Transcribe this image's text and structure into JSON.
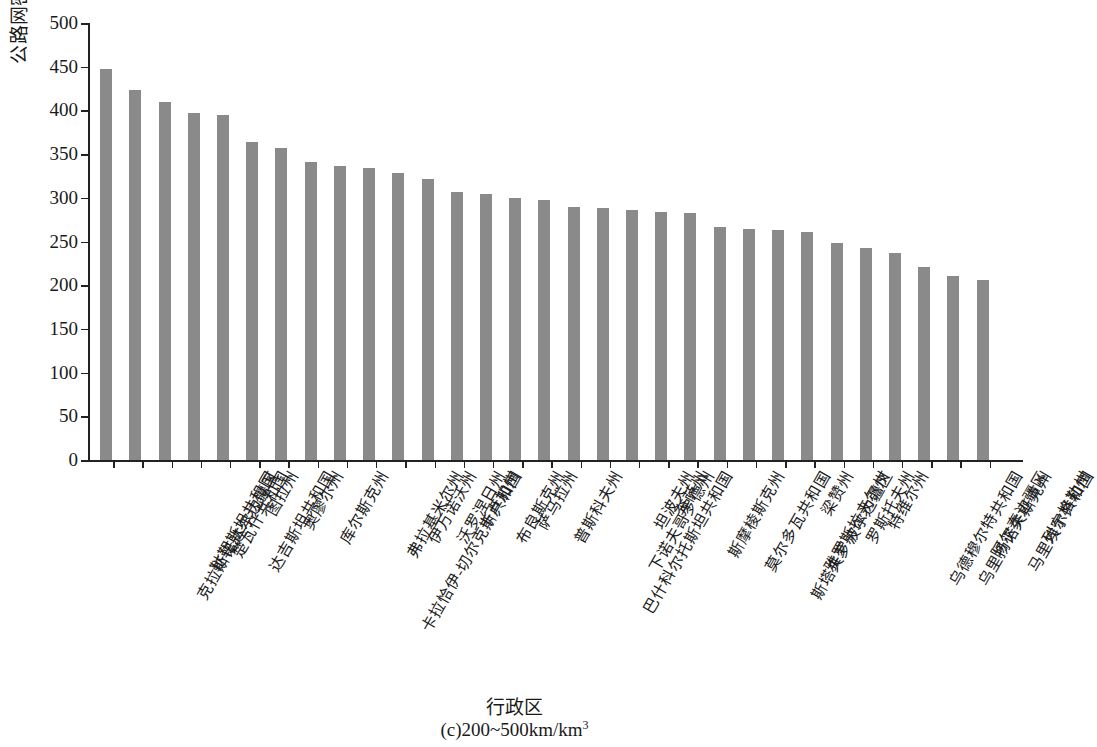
{
  "chart_data": {
    "type": "bar",
    "title": "",
    "caption": "(c)200~500km/km³",
    "caption_main": "(c)200~500km/km",
    "caption_sup": "3",
    "xlabel": "行政区",
    "ylabel": "公路网密度/(km/km³)",
    "ylabel_main": "公路网密度/(km/km",
    "ylabel_sup": "3",
    "ylabel_tail": ")",
    "ylim": [
      0,
      500
    ],
    "ytick_step": 50,
    "yticks": [
      0,
      50,
      100,
      150,
      200,
      250,
      300,
      350,
      400,
      450,
      500
    ],
    "grid": false,
    "legend": null,
    "bar_color": "#8a8a8a",
    "axis_color": "#222222",
    "categories": [
      "克拉斯诺达尔边疆区",
      "鞑靼斯坦共和国",
      "楚瓦什共和国",
      "达吉斯坦共和国",
      "图拉州",
      "奥廖尔州",
      "库尔斯克州",
      "卡拉恰伊-切尔克斯共和国",
      "弗拉基米尔州",
      "伊万诺沃州",
      "沃罗涅日州",
      "卡卢加州",
      "布良斯克州",
      "萨马拉州",
      "普斯科夫州",
      "巴什科尔托斯坦共和国",
      "下诺夫哥罗德州",
      "坦波夫州",
      "奔萨州",
      "斯摩棱斯克州",
      "莫尔多瓦共和国",
      "斯塔夫罗波尔边疆区",
      "雅罗斯拉夫尔州",
      "梁赞州",
      "罗斯托夫州",
      "特维尔州",
      "乌德穆尔特共和国",
      "乌里扬诺夫斯克州",
      "阿尔泰边疆区",
      "马里埃尔共和国",
      "列宁格勒州"
    ],
    "values": [
      447,
      423,
      410,
      397,
      395,
      364,
      357,
      341,
      336,
      334,
      328,
      321,
      307,
      304,
      300,
      297,
      290,
      288,
      286,
      284,
      283,
      267,
      264,
      263,
      261,
      248,
      243,
      237,
      221,
      210,
      206
    ]
  }
}
